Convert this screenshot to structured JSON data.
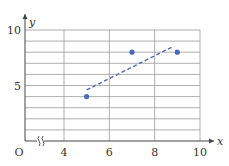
{
  "chart_data": {
    "type": "scatter",
    "title": "",
    "xlabel": "x",
    "ylabel": "y",
    "origin_label": "O",
    "xlim": [
      0,
      10
    ],
    "ylim": [
      0,
      10
    ],
    "x_axis_break": true,
    "x_ticks": [
      4,
      6,
      8,
      10
    ],
    "x_tick_labels": [
      "4",
      "6",
      "8",
      "10"
    ],
    "y_ticks": [
      5,
      10
    ],
    "y_tick_labels": [
      "5",
      "10"
    ],
    "grid": true,
    "grid_x_values": [
      4,
      6,
      8,
      10
    ],
    "grid_y_step": 1,
    "series": [
      {
        "name": "data points",
        "points": [
          {
            "x": 5,
            "y": 4
          },
          {
            "x": 7,
            "y": 8
          },
          {
            "x": 9,
            "y": 8
          }
        ],
        "color": "#4a6bb5"
      }
    ],
    "trendline": {
      "style": "dashed",
      "color": "#4a6bb5",
      "from": {
        "x": 5,
        "y": 4.6
      },
      "to": {
        "x": 8.8,
        "y": 8.5
      }
    }
  }
}
